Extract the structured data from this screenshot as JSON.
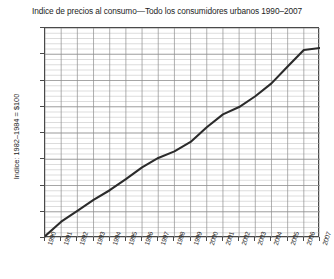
{
  "chart_data": {
    "type": "line",
    "title": "Indice de precios al consumo—Todo los consumidores urbanos 1990–2007",
    "xlabel": "",
    "ylabel": "Indice: 1982–1984 = $100",
    "ylim": [
      130,
      210
    ],
    "xlim": [
      1990,
      2007
    ],
    "ytick_step": 10,
    "ytick_labels": [
      "210",
      "200",
      "190",
      "180",
      "170",
      "160",
      "150",
      "140",
      "130"
    ],
    "ytick_values": [
      210,
      200,
      190,
      180,
      170,
      160,
      150,
      140,
      130
    ],
    "minor_gridlines_per_step": 5,
    "grid": true,
    "legend": false,
    "line_color": "#2b2b2b",
    "grid_color": "#b9b9b9",
    "axis_color": "#4a4a4a",
    "categories": [
      "1990",
      "1991",
      "1992",
      "1993",
      "1994",
      "1995",
      "1996",
      "1997",
      "1998",
      "1999",
      "2000",
      "2001",
      "2002",
      "2003",
      "2004",
      "2005",
      "2006",
      "2007"
    ],
    "series": [
      {
        "name": "Indice de precios al consumo",
        "values": [
          130.7,
          136.2,
          140.3,
          144.5,
          148.2,
          152.4,
          156.9,
          160.5,
          163.0,
          166.6,
          172.2,
          177.1,
          179.9,
          184.0,
          188.9,
          195.3,
          201.6,
          202.4
        ]
      }
    ]
  }
}
